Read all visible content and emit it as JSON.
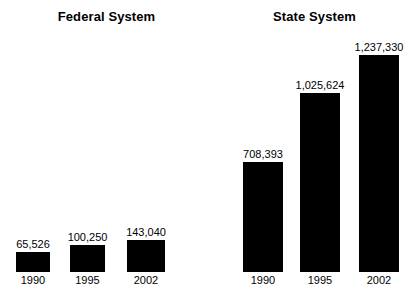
{
  "chart_data": {
    "type": "bar",
    "title": "",
    "xlabel": "",
    "ylabel": "",
    "grid": false,
    "legend": "none",
    "orientation": "vertical",
    "bar_color": "#000000",
    "background": "#ffffff",
    "panels": [
      {
        "id": "federal",
        "title": "Federal System",
        "categories": [
          "1990",
          "1995",
          "2002"
        ],
        "values": [
          65526,
          100250,
          143040
        ],
        "value_labels": [
          "65,526",
          "100,250",
          "143,040"
        ],
        "ylim": [
          0,
          143040
        ],
        "bar_px": {
          "x": [
            16,
            70,
            127
          ],
          "width": [
            34,
            35,
            38
          ],
          "height": [
            20,
            27,
            32
          ]
        }
      },
      {
        "id": "state",
        "title": "State System",
        "categories": [
          "1990",
          "1995",
          "2002"
        ],
        "values": [
          708393,
          1025624,
          1237330
        ],
        "value_labels": [
          "708,393",
          "1,025,624",
          "1,237,330"
        ],
        "ylim": [
          0,
          1237330
        ],
        "bar_px": {
          "x": [
            36,
            93,
            152
          ],
          "width": [
            40,
            40,
            40
          ],
          "height": [
            110,
            179,
            217
          ]
        }
      }
    ]
  }
}
